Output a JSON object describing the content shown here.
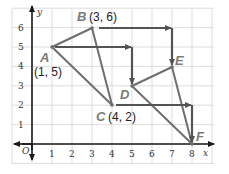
{
  "diagram": {
    "type": "coordinate-plane-transformation",
    "axes": {
      "x_label": "x",
      "y_label": "y",
      "origin_label": "O",
      "x_ticks": [
        "1",
        "2",
        "3",
        "4",
        "5",
        "6",
        "7",
        "8"
      ],
      "y_ticks": [
        "1",
        "2",
        "3",
        "4",
        "5",
        "6"
      ],
      "x_range": [
        -0.5,
        8.5
      ],
      "y_range": [
        -0.5,
        6.8
      ]
    },
    "points": [
      {
        "name": "A",
        "x": 1,
        "y": 5,
        "coord_label": "(1, 5)"
      },
      {
        "name": "B",
        "x": 3,
        "y": 6,
        "coord_label": "(3, 6)"
      },
      {
        "name": "C",
        "x": 4,
        "y": 2,
        "coord_label": "(4, 2)"
      },
      {
        "name": "D",
        "x": 5,
        "y": 3,
        "coord_label": ""
      },
      {
        "name": "E",
        "x": 7,
        "y": 4,
        "coord_label": ""
      },
      {
        "name": "F",
        "x": 8,
        "y": 0,
        "coord_label": ""
      }
    ],
    "triangles": [
      {
        "name": "ABC",
        "vertices": [
          "A",
          "B",
          "C"
        ]
      },
      {
        "name": "DEF",
        "vertices": [
          "D",
          "E",
          "F"
        ]
      }
    ],
    "translation_arrows": [
      {
        "from": "A",
        "via": [
          5,
          5
        ],
        "to": "D"
      },
      {
        "from": "B",
        "via": [
          7,
          6
        ],
        "to": "E"
      },
      {
        "from": "C",
        "via": [
          8,
          2
        ],
        "to": "F"
      }
    ],
    "colors": {
      "segment": "#6e6e6e",
      "arrow": "#545454",
      "grid": "#d4d4d4",
      "axis": "#1a1a1a",
      "point_label": "#7a7a7a"
    }
  }
}
